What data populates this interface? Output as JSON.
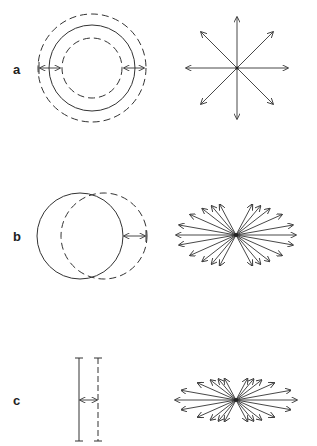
{
  "panels": [
    {
      "label": "a",
      "description": "isotropic expansion: concentric circles with radial arrows",
      "shape": {
        "center": [
          92,
          68
        ],
        "outer_dashed_r": 54,
        "solid_r": 43,
        "inner_dashed_r": 30
      },
      "arrows": {
        "center": [
          237,
          68
        ],
        "type": "star",
        "count": 8,
        "length": 51
      }
    },
    {
      "label": "b",
      "description": "translation: solid circle and shifted dashed circle",
      "shape": {
        "solid_center": [
          80,
          236
        ],
        "dashed_center": [
          104,
          236
        ],
        "r": 43
      },
      "arrows": {
        "center": [
          236,
          235
        ],
        "type": "bowtie",
        "rx": 60,
        "ry": 32
      }
    },
    {
      "label": "c",
      "description": "line displacement: solid and dashed parallel lines",
      "shape": {
        "solid_x": 79,
        "dashed_x": 98,
        "y1": 358,
        "y2": 441
      },
      "arrows": {
        "center": [
          236,
          400
        ],
        "type": "bowtie",
        "rx": 61,
        "ry": 22
      }
    }
  ]
}
